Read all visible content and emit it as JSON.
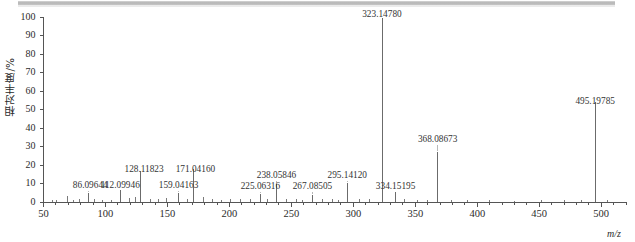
{
  "figure": {
    "ylabel": "相对丰度/%",
    "xlabel": "m/z"
  },
  "axes": {
    "y_ticks": [
      "0",
      "10",
      "20",
      "30",
      "40",
      "50",
      "60",
      "70",
      "80",
      "90",
      "100"
    ],
    "x_ticks": [
      "50",
      "100",
      "150",
      "200",
      "250",
      "300",
      "350",
      "400",
      "450",
      "500"
    ]
  },
  "chart_data": {
    "type": "bar",
    "title": "",
    "xlabel": "m/z",
    "ylabel": "相对丰度/%",
    "xlim": [
      50,
      520
    ],
    "ylim": [
      0,
      100
    ],
    "grid": false,
    "legend": false,
    "peaks": [
      {
        "mz": 86.09644,
        "intensity": 5.0,
        "label": "86.09644"
      },
      {
        "mz": 112.09946,
        "intensity": 6.5,
        "label": "112.09946"
      },
      {
        "mz": 128.11823,
        "intensity": 17.0,
        "label": "128.11823"
      },
      {
        "mz": 159.04163,
        "intensity": 5.0,
        "label": "159.04163"
      },
      {
        "mz": 171.0416,
        "intensity": 18.0,
        "label": "171.04160"
      },
      {
        "mz": 225.06316,
        "intensity": 4.5,
        "label": "225.06316"
      },
      {
        "mz": 238.05846,
        "intensity": 9.5,
        "label": "238.05846"
      },
      {
        "mz": 267.08505,
        "intensity": 4.0,
        "label": "267.08505"
      },
      {
        "mz": 295.1412,
        "intensity": 10.5,
        "label": "295.14120"
      },
      {
        "mz": 323.1478,
        "intensity": 100.0,
        "label": "323.14780"
      },
      {
        "mz": 334.15195,
        "intensity": 5.5,
        "label": "334.15195"
      },
      {
        "mz": 368.08673,
        "intensity": 27.0,
        "label": "368.08673"
      },
      {
        "mz": 495.19785,
        "intensity": 54.0,
        "label": "495.19785"
      }
    ],
    "unlabeled_peaks": [
      {
        "mz": 57.0,
        "intensity": 1.2
      },
      {
        "mz": 60.5,
        "intensity": 1.0
      },
      {
        "mz": 69.5,
        "intensity": 3.0
      },
      {
        "mz": 74.0,
        "intensity": 1.2
      },
      {
        "mz": 79.0,
        "intensity": 1.5
      },
      {
        "mz": 91.0,
        "intensity": 1.8
      },
      {
        "mz": 98.0,
        "intensity": 1.2
      },
      {
        "mz": 105.0,
        "intensity": 1.3
      },
      {
        "mz": 119.0,
        "intensity": 2.0
      },
      {
        "mz": 124.5,
        "intensity": 2.5
      },
      {
        "mz": 136.0,
        "intensity": 1.5
      },
      {
        "mz": 143.0,
        "intensity": 1.6
      },
      {
        "mz": 149.5,
        "intensity": 2.2
      },
      {
        "mz": 166.0,
        "intensity": 1.5
      },
      {
        "mz": 179.0,
        "intensity": 2.5
      },
      {
        "mz": 186.0,
        "intensity": 1.4
      },
      {
        "mz": 193.5,
        "intensity": 1.3
      },
      {
        "mz": 201.0,
        "intensity": 1.6
      },
      {
        "mz": 209.0,
        "intensity": 1.5
      },
      {
        "mz": 217.0,
        "intensity": 1.4
      },
      {
        "mz": 231.0,
        "intensity": 1.8
      },
      {
        "mz": 246.0,
        "intensity": 1.5
      },
      {
        "mz": 254.0,
        "intensity": 1.6
      },
      {
        "mz": 259.0,
        "intensity": 1.3
      },
      {
        "mz": 275.0,
        "intensity": 1.5
      },
      {
        "mz": 283.0,
        "intensity": 1.8
      },
      {
        "mz": 288.0,
        "intensity": 1.2
      },
      {
        "mz": 305.0,
        "intensity": 1.6
      },
      {
        "mz": 313.0,
        "intensity": 1.5
      },
      {
        "mz": 341.0,
        "intensity": 1.4
      },
      {
        "mz": 352.0,
        "intensity": 1.3
      },
      {
        "mz": 360.0,
        "intensity": 1.2
      },
      {
        "mz": 379.0,
        "intensity": 1.0
      },
      {
        "mz": 392.0,
        "intensity": 0.9
      },
      {
        "mz": 410.0,
        "intensity": 0.9
      },
      {
        "mz": 430.0,
        "intensity": 0.8
      },
      {
        "mz": 452.0,
        "intensity": 0.9
      },
      {
        "mz": 470.0,
        "intensity": 0.9
      },
      {
        "mz": 484.0,
        "intensity": 1.0
      },
      {
        "mz": 505.0,
        "intensity": 1.0
      }
    ]
  },
  "colors": {
    "axis": "#555555",
    "trace": "#6b6b6b",
    "text": "#2b2b2b"
  }
}
